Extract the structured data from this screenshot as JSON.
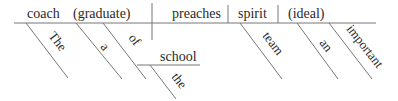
{
  "diagram": {
    "type": "sentence-diagram",
    "line_color": "#777777",
    "text_color": "#2a2a2a",
    "baseline": {
      "subject": "coach",
      "appositive": "(graduate)",
      "verb": "preaches",
      "direct_object": "spirit",
      "object_complement": "(ideal)"
    },
    "modifiers": {
      "coach_article": "The",
      "graduate_article": "a",
      "preposition": "of",
      "prep_object": "school",
      "prep_object_article": "the",
      "spirit_modifier": "team",
      "ideal_article": "an",
      "ideal_adjective": "important"
    }
  }
}
